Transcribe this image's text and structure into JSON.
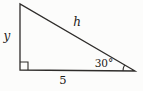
{
  "diagram": {
    "type": "right-triangle",
    "labels": {
      "hypotenuse": "h",
      "vertical_leg": "y",
      "base": "5",
      "angle": "30°"
    },
    "geometry": {
      "triangle_points": "20,4 20,70 135,71",
      "right_angle_marker_path": "M 20,62 L 28,62 L 28,70",
      "angle_arc_path": "M 124.6,65 A 12 12 0 0 0 123,70.9"
    },
    "colors": {
      "line": "#2e2c2a",
      "text": "#1c1a18",
      "background": "#fcfcfb"
    }
  }
}
